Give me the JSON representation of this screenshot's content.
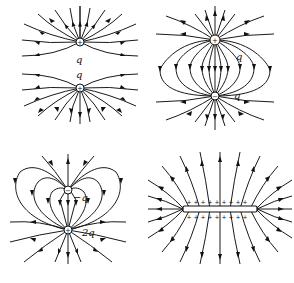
{
  "figure": {
    "panels": [
      {
        "id": "two-positive-charges",
        "charges": [
          {
            "sign": "+",
            "label": "q"
          },
          {
            "sign": "+",
            "label": "q"
          }
        ]
      },
      {
        "id": "dipole",
        "charges": [
          {
            "sign": "+",
            "label": "q"
          },
          {
            "sign": "−",
            "label": "q"
          }
        ]
      },
      {
        "id": "unequal-charges",
        "charges": [
          {
            "sign": "−",
            "label": "−q"
          },
          {
            "sign": "+",
            "label": "2q"
          }
        ]
      },
      {
        "id": "charged-plate",
        "plate_sign": "+",
        "plus_signs_count": 9
      }
    ],
    "colors": {
      "line": "#1a1a1a",
      "background": "#ffffff"
    }
  }
}
